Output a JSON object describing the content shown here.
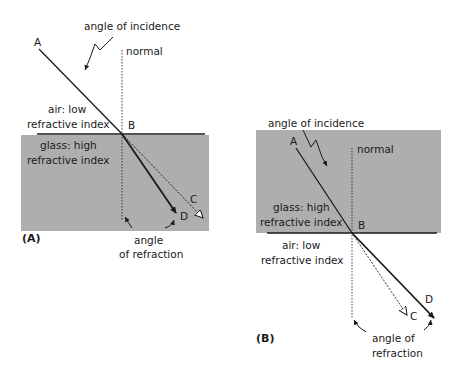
{
  "figure_a": {
    "label": "(A)",
    "angle_of_incidence": "angle of incidence",
    "normal": "normal",
    "point_a": "A",
    "point_b": "B",
    "point_c": "C",
    "point_d": "D",
    "upper_medium_line1": "air: low",
    "upper_medium_line2": "refractive index",
    "lower_medium_line1": "glass: high",
    "lower_medium_line2": "refractive index",
    "angle_of_refraction_line1": "angle",
    "angle_of_refraction_line2": "of refraction"
  },
  "figure_b": {
    "label": "(B)",
    "angle_of_incidence": "angle of incidence",
    "normal": "normal",
    "point_a": "A",
    "point_b": "B",
    "point_c": "C",
    "point_d": "D",
    "upper_medium_line1": "glass: high",
    "upper_medium_line2": "refractive index",
    "lower_medium_line1": "air: low",
    "lower_medium_line2": "refractive index",
    "angle_of_refraction_line1": "angle of",
    "angle_of_refraction_line2": "refraction"
  },
  "colors": {
    "glass": "#aeaeae",
    "line": "#1a1a1a"
  }
}
